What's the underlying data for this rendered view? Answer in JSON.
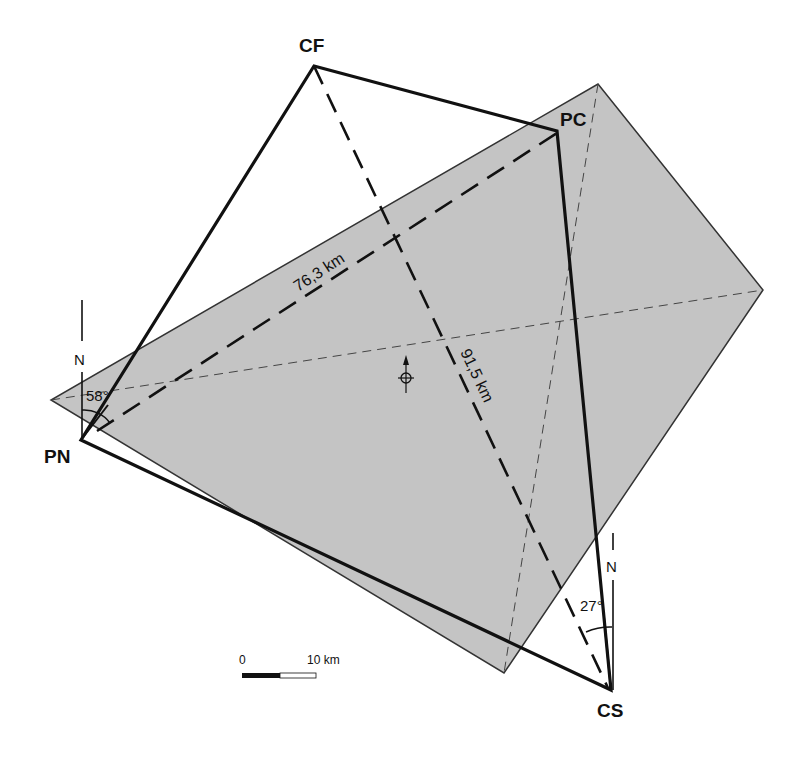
{
  "diagram": {
    "colors": {
      "background": "#ffffff",
      "footprint_fill": "#c4c4c4",
      "footprint_stroke": "#333333",
      "line": "#111111"
    },
    "footprint": {
      "corners": {
        "top": [
          598,
          84
        ],
        "right": [
          763,
          290
        ],
        "bottom": [
          504,
          673
        ],
        "left": [
          51,
          400
        ]
      }
    },
    "vertices": [
      {
        "id": "CF",
        "label": "CF",
        "x": 314,
        "y": 66
      },
      {
        "id": "PC",
        "label": "PC",
        "x": 557,
        "y": 131
      },
      {
        "id": "CS",
        "label": "CS",
        "x": 611,
        "y": 690
      },
      {
        "id": "PN",
        "label": "PN",
        "x": 81,
        "y": 440
      }
    ],
    "distances": [
      {
        "label": "76,3 km",
        "from": "PN",
        "to": "PC"
      },
      {
        "label": "91,5 km",
        "from": "CF",
        "to": "CS"
      }
    ],
    "angles": [
      {
        "label": "58°",
        "at": "PN",
        "north_label": "N"
      },
      {
        "label": "27°",
        "at": "CS",
        "north_label": "N"
      }
    ],
    "center_marker": {
      "name": "centroid-with-north-arrow"
    },
    "scale_bar": {
      "start_label": "0",
      "end_label": "10 km"
    }
  }
}
